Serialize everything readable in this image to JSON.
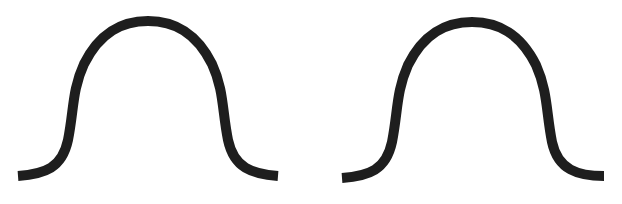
{
  "figure": {
    "type": "diagram",
    "stroke_color": "#1e1e1e",
    "background_color": "#ffffff",
    "stroke_width": 10
  },
  "curves": [
    {
      "id": "left",
      "shape": "bell-curve",
      "path": "M 18 176 C 45 174, 62 168, 68 140 C 74 110, 72 90, 84 64 C 100 32, 122 21, 148 21 C 174 21, 196 32, 212 64 C 224 90, 222 110, 228 140 C 234 168, 252 174, 278 176"
    },
    {
      "id": "right",
      "shape": "bell-curve",
      "path": "M 342 178 C 369 176, 386 170, 392 142 C 398 112, 396 92, 408 65 C 424 33, 446 22, 472 22 C 498 22, 520 33, 536 65 C 548 92, 546 112, 552 142 C 558 170, 578 176, 604 176"
    }
  ]
}
